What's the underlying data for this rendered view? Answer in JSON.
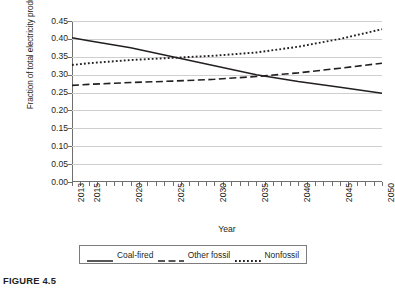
{
  "caption": "FIGURE 4.5",
  "chart_data": {
    "type": "line",
    "title": "",
    "xlabel": "Year",
    "ylabel": "Fraction of total electricity production",
    "xlim": [
      2013,
      2050
    ],
    "ylim": [
      0.0,
      0.45
    ],
    "ytick_labels": [
      "0.45",
      "0.40",
      "0.35",
      "0.30",
      "0.25",
      "0.20",
      "0.15",
      "0.10",
      "0.05",
      "0.00"
    ],
    "ytick_values": [
      0.45,
      0.4,
      0.35,
      0.3,
      0.25,
      0.2,
      0.15,
      0.1,
      0.05,
      0.0
    ],
    "xtick_labels": [
      "2013",
      "2015",
      "2020",
      "2025",
      "2030",
      "2035",
      "2040",
      "2045",
      "2050"
    ],
    "xtick_values": [
      2013,
      2015,
      2020,
      2025,
      2030,
      2035,
      2040,
      2045,
      2050
    ],
    "grid": "horizontal",
    "legend_position": "below-axes",
    "x": [
      2013,
      2015,
      2020,
      2025,
      2030,
      2035,
      2040,
      2045,
      2050
    ],
    "series": [
      {
        "name": "Coal-fired",
        "style": "solid",
        "color": "#231f20",
        "values": [
          0.403,
          0.395,
          0.375,
          0.35,
          0.325,
          0.3,
          0.281,
          0.265,
          0.248
        ]
      },
      {
        "name": "Other fossil",
        "style": "dashed",
        "color": "#231f20",
        "values": [
          0.27,
          0.273,
          0.278,
          0.282,
          0.287,
          0.295,
          0.305,
          0.318,
          0.332
        ]
      },
      {
        "name": "Nonfossil",
        "style": "dotted",
        "color": "#231f20",
        "values": [
          0.327,
          0.332,
          0.341,
          0.347,
          0.353,
          0.362,
          0.378,
          0.4,
          0.427
        ]
      }
    ]
  },
  "legend": {
    "items": [
      {
        "label": "Coal-fired",
        "style": "solid"
      },
      {
        "label": "Other fossil",
        "style": "dashed"
      },
      {
        "label": "Nonfossil",
        "style": "dotted"
      }
    ]
  }
}
